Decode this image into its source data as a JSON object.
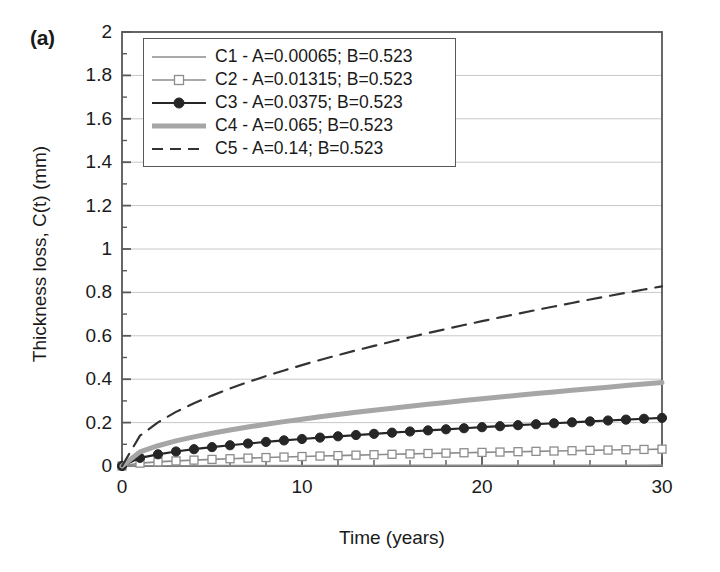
{
  "panel": {
    "label": "(a)"
  },
  "chart_data": {
    "type": "line",
    "title": "",
    "panel_label": "(a)",
    "xlabel": "Time (years)",
    "ylabel": "Thickness loss, C(t) (mm)",
    "xlim": [
      0,
      30
    ],
    "ylim": [
      0,
      2
    ],
    "x_ticks": [
      "0",
      "10",
      "20",
      "30"
    ],
    "x_tick_values": [
      0,
      10,
      20,
      30
    ],
    "x_minor_tick_interval": 2,
    "y_ticks": [
      "0",
      "0.2",
      "0.4",
      "0.6",
      "0.8",
      "1",
      "1.2",
      "1.4",
      "1.6",
      "1.8",
      "2"
    ],
    "y_tick_values": [
      0,
      0.2,
      0.4,
      0.6,
      0.8,
      1,
      1.2,
      1.4,
      1.6,
      1.8,
      2
    ],
    "grid": true,
    "grid_axis": "y",
    "legend_position": "upper-left-inside",
    "model": "C(t) = A * t^B",
    "x": [
      0,
      1,
      2,
      3,
      4,
      5,
      6,
      7,
      8,
      9,
      10,
      11,
      12,
      13,
      14,
      15,
      16,
      17,
      18,
      19,
      20,
      21,
      22,
      23,
      24,
      25,
      26,
      27,
      28,
      29,
      30
    ],
    "series": [
      {
        "name": "C1",
        "label": "C1 - A=0.00065; B=0.523",
        "A": 0.00065,
        "B": 0.523,
        "color": "#8c8c8c",
        "style": "solid-thin",
        "marker": "none",
        "values": [
          0,
          0.00065,
          0.00093,
          0.00116,
          0.00134,
          0.0015,
          0.00165,
          0.00179,
          0.00192,
          0.00204,
          0.00216,
          0.00227,
          0.00237,
          0.00247,
          0.00257,
          0.00267,
          0.00276,
          0.00285,
          0.00294,
          0.00302,
          0.00311,
          0.00319,
          0.00327,
          0.00334,
          0.00342,
          0.00349,
          0.00357,
          0.00364,
          0.00371,
          0.00378,
          0.00385
        ]
      },
      {
        "name": "C2",
        "label": "C2 - A=0.01315; B=0.523",
        "A": 0.01315,
        "B": 0.523,
        "color": "#8c8c8c",
        "style": "solid-thin",
        "marker": "open-square",
        "values": [
          0,
          0.0132,
          0.0189,
          0.0234,
          0.0271,
          0.0305,
          0.0335,
          0.0363,
          0.0389,
          0.0413,
          0.0437,
          0.0459,
          0.048,
          0.05,
          0.052,
          0.0539,
          0.0558,
          0.0576,
          0.0593,
          0.061,
          0.0627,
          0.0643,
          0.0659,
          0.0675,
          0.069,
          0.0705,
          0.072,
          0.0735,
          0.0749,
          0.0763,
          0.0777
        ]
      },
      {
        "name": "C3",
        "label": "C3 - A=0.0375; B=0.523",
        "A": 0.0375,
        "B": 0.523,
        "color": "#262626",
        "style": "solid-medium",
        "marker": "filled-circle",
        "values": [
          0,
          0.0375,
          0.0539,
          0.0668,
          0.0774,
          0.0869,
          0.0956,
          0.1036,
          0.111,
          0.1179,
          0.1245,
          0.1309,
          0.1369,
          0.1427,
          0.1483,
          0.1537,
          0.159,
          0.1641,
          0.1691,
          0.174,
          0.1788,
          0.1834,
          0.188,
          0.1925,
          0.1969,
          0.2012,
          0.2054,
          0.2096,
          0.2137,
          0.2177,
          0.2217
        ]
      },
      {
        "name": "C4",
        "label": "C4 - A=0.065; B=0.523",
        "A": 0.065,
        "B": 0.523,
        "color": "#a6a6a6",
        "style": "solid-thick",
        "marker": "none",
        "values": [
          0,
          0.065,
          0.0934,
          0.1158,
          0.1342,
          0.1506,
          0.1657,
          0.1796,
          0.1925,
          0.2044,
          0.2159,
          0.2269,
          0.2373,
          0.2473,
          0.257,
          0.2664,
          0.2756,
          0.2845,
          0.2931,
          0.3016,
          0.3099,
          0.318,
          0.3259,
          0.3337,
          0.3413,
          0.3488,
          0.3562,
          0.3634,
          0.3705,
          0.3775,
          0.3844
        ]
      },
      {
        "name": "C5",
        "label": "C5 - A=0.14; B=0.523",
        "A": 0.14,
        "B": 0.523,
        "color": "#333333",
        "style": "dashed",
        "marker": "none",
        "values": [
          0,
          0.14,
          0.2012,
          0.2494,
          0.2891,
          0.3244,
          0.3569,
          0.3869,
          0.4145,
          0.4402,
          0.465,
          0.4886,
          0.5111,
          0.5327,
          0.5535,
          0.5737,
          0.5934,
          0.6127,
          0.6314,
          0.6496,
          0.6675,
          0.6849,
          0.702,
          0.7187,
          0.7352,
          0.7513,
          0.7672,
          0.7829,
          0.7982,
          0.8133,
          0.8281
        ]
      }
    ]
  },
  "legend": {
    "entries": [
      {
        "label": "C1 - A=0.00065; B=0.523"
      },
      {
        "label": "C2 - A=0.01315; B=0.523"
      },
      {
        "label": "C3 - A=0.0375; B=0.523"
      },
      {
        "label": "C4 - A=0.065; B=0.523"
      },
      {
        "label": "C5 - A=0.14; B=0.523"
      }
    ]
  },
  "colors": {
    "axis": "#585858",
    "grid": "#c8c8c8",
    "text": "#1a1a1a",
    "c1": "#8c8c8c",
    "c2": "#8c8c8c",
    "c3": "#262626",
    "c4": "#a6a6a6",
    "c5": "#333333"
  }
}
